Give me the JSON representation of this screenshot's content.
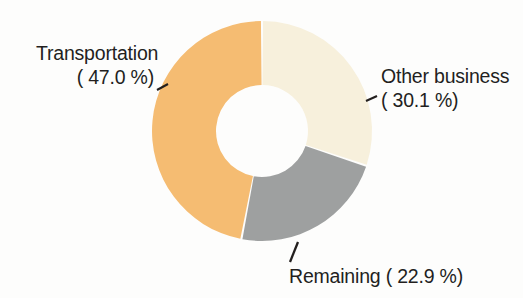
{
  "chart_data": {
    "type": "pie",
    "variant": "donut",
    "title": "",
    "subtitle": "",
    "xlabel": "",
    "ylabel": "",
    "legend_position": "none",
    "grid": false,
    "units": "%",
    "start_angle_deg": 0,
    "direction": "clockwise",
    "categories": [
      "Other business",
      "Remaining",
      "Transportation"
    ],
    "values": [
      30.1,
      22.9,
      47.0
    ],
    "slices": [
      {
        "name": "Other business",
        "value": 30.1,
        "label_line1": "Other business",
        "label_line2": "( 30.1 %)",
        "color": "#f7f0dc",
        "leader": "dash-left"
      },
      {
        "name": "Remaining",
        "value": 22.9,
        "label_line1": "Remaining ( 22.9 %)",
        "label_line2": "",
        "color": "#9ea0a0",
        "leader": "diagonal-up"
      },
      {
        "name": "Transportation",
        "value": 47.0,
        "label_line1": "Transportation",
        "label_line2": "( 47.0 %)",
        "color": "#f5bc72",
        "leader": "dash-right"
      }
    ],
    "colors": {
      "transportation": "#f5bc72",
      "other_business": "#f7f0dc",
      "remaining": "#9ea0a0",
      "hole": "#ffffff",
      "text": "#231f1e",
      "background": "#fdfdfc"
    },
    "geometry": {
      "center_x": 262,
      "center_y": 131,
      "outer_radius": 110,
      "inner_radius": 46
    }
  }
}
